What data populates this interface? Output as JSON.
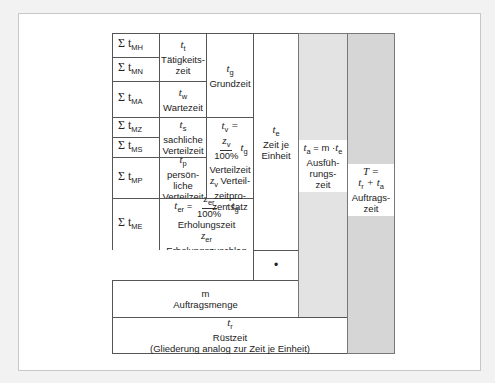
{
  "diagram": {
    "components": [
      {
        "id": "MH",
        "sum_label": "Σ t",
        "sub": "MH"
      },
      {
        "id": "MN",
        "sum_label": "Σ t",
        "sub": "MN"
      },
      {
        "id": "MA",
        "sum_label": "Σ t",
        "sub": "MA"
      },
      {
        "id": "MZ",
        "sum_label": "Σ t",
        "sub": "MZ"
      },
      {
        "id": "MS",
        "sum_label": "Σ t",
        "sub": "MS"
      },
      {
        "id": "MP",
        "sum_label": "Σ t",
        "sub": "MP"
      },
      {
        "id": "ME",
        "sum_label": "Σ t",
        "sub": "ME"
      }
    ],
    "taetigkeitszeit": {
      "symbol": "t",
      "sub": "t",
      "label_line1": "Tätigkeits-",
      "label_line2": "zeit"
    },
    "wartezeit": {
      "symbol": "t",
      "sub": "w",
      "label": "Wartezeit"
    },
    "grundzeit": {
      "symbol": "t",
      "sub": "g",
      "label": "Grundzeit"
    },
    "sachliche_verteilzeit": {
      "symbol": "t",
      "sub": "s",
      "label_line1": "sachliche",
      "label_line2": "Verteilzeit"
    },
    "persoenliche_verteilzeit": {
      "symbol": "t",
      "sub": "p",
      "label_line1": "persön-",
      "label_line2": "liche",
      "label_line3": "Verteilzeit"
    },
    "verteilzeit": {
      "lhs": "t",
      "lhs_sub": "v",
      "eq": "=",
      "num": "z",
      "num_sub": "v",
      "den": "100%",
      "times": "t",
      "times_sub": "g",
      "label": "Verteilzeit",
      "z_sym": "z",
      "z_sub": "v",
      "z_label_line1": "Verteil-",
      "z_label_line2": "zeitpro-",
      "z_label_line3": "zentsatz"
    },
    "erholungszeit": {
      "lhs": "t",
      "lhs_sub": "er",
      "eq": "=",
      "num": "z",
      "num_sub": "er",
      "den": "100%",
      "times": "· t",
      "times_sub": "g",
      "label": "Erholungszeit",
      "z_sym": "z",
      "z_sub": "er",
      "z_label": "Erholungszuschlag"
    },
    "zeit_je_einheit": {
      "symbol": "t",
      "sub": "e",
      "label_line1": "Zeit je",
      "label_line2": "Einheit"
    },
    "multiply": "•",
    "ausfuehrungszeit": {
      "formula_lhs": "t",
      "lhs_sub": "a",
      "formula_mid": " = m ·",
      "rhs": "t",
      "rhs_sub": "e",
      "label_line1": "Ausfüh-",
      "label_line2": "rungs-",
      "label_line3": "zeit"
    },
    "auftragszeit": {
      "formula_line1": "T =",
      "r": "t",
      "r_sub": "r",
      "plus": " + ",
      "a": "t",
      "a_sub": "a",
      "label_line1": "Auftrags-",
      "label_line2": "zeit"
    },
    "auftragsmenge": {
      "symbol": "m",
      "label": "Auftragsmenge"
    },
    "ruestzeit": {
      "symbol": "t",
      "sub": "r",
      "label": "Rüstzeit",
      "note": "(Gliederung analog zur Zeit je Einheit)"
    }
  }
}
